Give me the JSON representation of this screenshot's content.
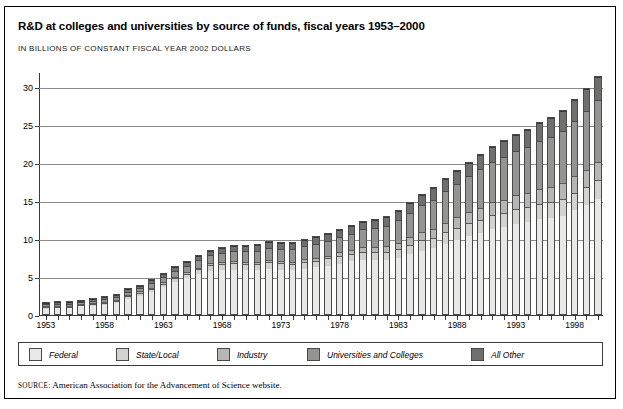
{
  "figure": {
    "title": "R&D at colleges and universities by source of funds, fiscal years 1953–2000",
    "subtitle": "IN BILLIONS OF CONSTANT FISCAL YEAR 2002 DOLLARS",
    "source_keyword": "SOURCE:",
    "source_text": "American Association for the Advancement of Science website."
  },
  "legend": {
    "items": [
      {
        "label": "Federal",
        "color": "#e8e8e6"
      },
      {
        "label": "State/Local",
        "color": "#d2d2ce"
      },
      {
        "label": "Industry",
        "color": "#b6b6b2"
      },
      {
        "label": "Universities and Colleges",
        "color": "#949492"
      },
      {
        "label": "All Other",
        "color": "#6f6f6e"
      }
    ]
  },
  "chart_data": {
    "type": "bar",
    "stacked": true,
    "title": "R&D at colleges and universities by source of funds, fiscal years 1953–2000",
    "subtitle": "IN BILLIONS OF CONSTANT FISCAL YEAR 2002 DOLLARS",
    "xlabel": "",
    "ylabel": "",
    "ylim": [
      0,
      32
    ],
    "yticks": [
      0,
      5,
      10,
      15,
      20,
      25,
      30
    ],
    "grid": true,
    "legend_position": "bottom",
    "categories": [
      "1953",
      "1954",
      "1955",
      "1956",
      "1957",
      "1958",
      "1959",
      "1960",
      "1961",
      "1962",
      "1963",
      "1964",
      "1965",
      "1966",
      "1967",
      "1968",
      "1969",
      "1970",
      "1971",
      "1972",
      "1973",
      "1974",
      "1975",
      "1976",
      "1977",
      "1978",
      "1979",
      "1980",
      "1981",
      "1982",
      "1983",
      "1984",
      "1985",
      "1986",
      "1987",
      "1988",
      "1989",
      "1990",
      "1991",
      "1992",
      "1993",
      "1994",
      "1995",
      "1996",
      "1997",
      "1998",
      "1999",
      "2000"
    ],
    "xtick_labels": [
      "1953",
      "1958",
      "1963",
      "1968",
      "1973",
      "1978",
      "1983",
      "1988",
      "1993",
      "1998"
    ],
    "series": [
      {
        "name": "Federal",
        "color": "#e8e8e6",
        "values": [
          0.9,
          1.0,
          1.0,
          1.2,
          1.3,
          1.4,
          1.7,
          2.2,
          2.6,
          3.1,
          3.7,
          4.4,
          4.9,
          5.4,
          5.8,
          6.0,
          6.0,
          5.9,
          5.9,
          6.1,
          6.0,
          5.9,
          6.1,
          6.3,
          6.5,
          6.8,
          7.1,
          7.3,
          7.2,
          7.2,
          7.5,
          8.0,
          8.5,
          8.8,
          9.4,
          9.9,
          10.4,
          10.8,
          11.3,
          11.6,
          12.0,
          12.3,
          12.6,
          12.8,
          13.1,
          13.8,
          14.5,
          15.3
        ]
      },
      {
        "name": "State/Local",
        "color": "#d2d2ce",
        "values": [
          0.2,
          0.2,
          0.2,
          0.2,
          0.2,
          0.3,
          0.3,
          0.3,
          0.4,
          0.4,
          0.5,
          0.5,
          0.6,
          0.7,
          0.8,
          0.8,
          0.9,
          0.9,
          0.9,
          0.9,
          0.9,
          0.9,
          0.9,
          0.9,
          1.0,
          1.0,
          1.0,
          1.1,
          1.1,
          1.1,
          1.2,
          1.3,
          1.4,
          1.4,
          1.5,
          1.6,
          1.7,
          1.8,
          1.9,
          1.9,
          2.0,
          2.0,
          2.1,
          2.1,
          2.2,
          2.3,
          2.4,
          2.5
        ]
      },
      {
        "name": "Industry",
        "color": "#b6b6b2",
        "values": [
          0.1,
          0.1,
          0.1,
          0.1,
          0.1,
          0.1,
          0.1,
          0.2,
          0.2,
          0.2,
          0.2,
          0.2,
          0.2,
          0.2,
          0.3,
          0.3,
          0.3,
          0.3,
          0.3,
          0.3,
          0.3,
          0.3,
          0.4,
          0.4,
          0.4,
          0.5,
          0.5,
          0.6,
          0.7,
          0.8,
          0.9,
          1.0,
          1.1,
          1.2,
          1.3,
          1.4,
          1.5,
          1.6,
          1.7,
          1.7,
          1.8,
          1.8,
          1.9,
          2.0,
          2.1,
          2.2,
          2.3,
          2.4
        ]
      },
      {
        "name": "Universities and Colleges",
        "color": "#949492",
        "values": [
          0.3,
          0.3,
          0.3,
          0.3,
          0.4,
          0.4,
          0.4,
          0.5,
          0.5,
          0.6,
          0.7,
          0.8,
          0.9,
          1.0,
          1.1,
          1.2,
          1.3,
          1.4,
          1.5,
          1.6,
          1.6,
          1.7,
          1.8,
          1.9,
          2.0,
          2.1,
          2.2,
          2.4,
          2.6,
          2.8,
          3.0,
          3.3,
          3.6,
          3.9,
          4.2,
          4.5,
          4.8,
          5.1,
          5.4,
          5.7,
          5.9,
          6.1,
          6.4,
          6.7,
          7.0,
          7.4,
          7.8,
          8.2
        ]
      },
      {
        "name": "All Other",
        "color": "#6f6f6e",
        "values": [
          0.2,
          0.2,
          0.2,
          0.2,
          0.2,
          0.3,
          0.3,
          0.3,
          0.3,
          0.4,
          0.4,
          0.5,
          0.5,
          0.6,
          0.6,
          0.7,
          0.7,
          0.7,
          0.7,
          0.8,
          0.8,
          0.8,
          0.8,
          0.9,
          0.9,
          0.9,
          1.0,
          1.0,
          1.1,
          1.1,
          1.2,
          1.3,
          1.4,
          1.5,
          1.6,
          1.7,
          1.8,
          1.9,
          2.0,
          2.1,
          2.2,
          2.3,
          2.4,
          2.5,
          2.6,
          2.7,
          2.9,
          3.1
        ]
      }
    ],
    "totals": [
      1.7,
      1.8,
      1.8,
      2.0,
      2.2,
      2.5,
      2.8,
      3.5,
      4.0,
      4.7,
      5.5,
      6.4,
      7.1,
      7.9,
      8.6,
      9.0,
      9.2,
      9.2,
      9.3,
      9.7,
      9.6,
      9.6,
      10.0,
      10.4,
      10.8,
      11.3,
      11.8,
      12.4,
      12.7,
      13.0,
      13.8,
      14.9,
      16.0,
      16.8,
      18.0,
      19.1,
      20.2,
      21.2,
      22.3,
      23.0,
      23.9,
      24.5,
      25.4,
      26.1,
      27.0,
      28.4,
      29.9,
      31.5
    ]
  }
}
